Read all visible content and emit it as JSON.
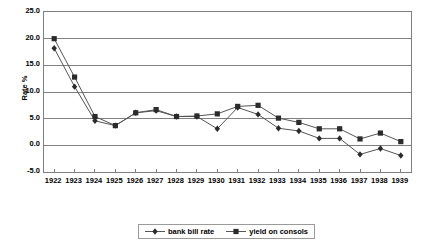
{
  "chart_data": {
    "type": "line",
    "title": "",
    "xlabel": "",
    "ylabel": "Rate %",
    "ylim": [
      -5.0,
      25.0
    ],
    "ytick_step": 5.0,
    "ytick_labels": [
      "25.0",
      "20.0",
      "15.0",
      "10.0",
      "5.0",
      "0.0",
      "-5.0"
    ],
    "ytick_values": [
      25.0,
      20.0,
      15.0,
      10.0,
      5.0,
      0.0,
      -5.0
    ],
    "grid": "horizontal",
    "legend_position": "bottom",
    "categories": [
      "1922",
      "1923",
      "1924",
      "1925",
      "1926",
      "1927",
      "1928",
      "1929",
      "1930",
      "1931",
      "1932",
      "1933",
      "1934",
      "1935",
      "1936",
      "1937",
      "1938",
      "1939"
    ],
    "series": [
      {
        "name": "bank bill rate",
        "marker": "diamond",
        "color": "#333333",
        "values": [
          18.2,
          11.0,
          4.6,
          3.7,
          6.1,
          6.5,
          5.4,
          5.4,
          3.1,
          7.1,
          5.8,
          3.2,
          2.7,
          1.3,
          1.3,
          -1.7,
          -0.6,
          -1.9
        ]
      },
      {
        "name": "yield on consols",
        "marker": "square",
        "color": "#333333",
        "values": [
          20.0,
          12.8,
          5.4,
          3.7,
          6.1,
          6.7,
          5.4,
          5.5,
          5.9,
          7.3,
          7.5,
          5.1,
          4.3,
          3.1,
          3.1,
          1.2,
          2.3,
          0.7
        ]
      }
    ]
  },
  "legend": {
    "items": [
      {
        "label": "bank bill rate"
      },
      {
        "label": "yield on consols"
      }
    ]
  },
  "colors": {
    "plot_border": "#7f7f7f",
    "gridline": "#808080",
    "series_line": "#555555",
    "marker": "#2b2b2b",
    "legend_border": "#9a9a9a",
    "background": "#ffffff"
  }
}
